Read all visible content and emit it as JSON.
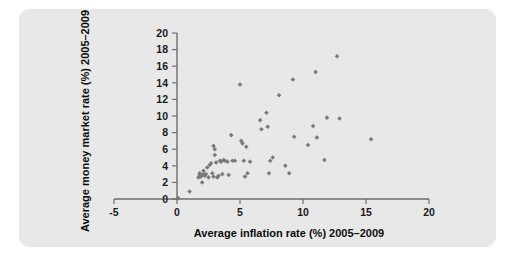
{
  "figure": {
    "panel_background": "#e8e8e8",
    "page_background": "#ffffff",
    "marker_color": "#7a7a7a",
    "axis_color": "#6e6e6e"
  },
  "chart_data": {
    "type": "scatter",
    "title": "",
    "xlabel": "Average inflation rate (%) 2005–2009",
    "ylabel": "Average money market rate (%) 2005–2009",
    "xlim": [
      -5,
      20
    ],
    "ylim": [
      0,
      20
    ],
    "xticks": [
      -5,
      0,
      5,
      10,
      15,
      20
    ],
    "yticks": [
      0,
      2,
      4,
      6,
      8,
      10,
      12,
      14,
      16,
      18,
      20
    ],
    "xtick_labels": [
      "-5",
      "0",
      "5",
      "10",
      "15",
      "20"
    ],
    "ytick_labels": [
      "0",
      "2",
      "4",
      "6",
      "8",
      "10",
      "12",
      "14",
      "16",
      "18",
      "20"
    ],
    "grid": false,
    "legend": null,
    "marker": "diamond",
    "series": [
      {
        "name": "Countries",
        "points": [
          [
            0.1,
            0.1
          ],
          [
            1.0,
            0.9
          ],
          [
            1.7,
            2.6
          ],
          [
            1.8,
            2.9
          ],
          [
            1.8,
            3.1
          ],
          [
            1.9,
            2.7
          ],
          [
            2.0,
            2.0
          ],
          [
            2.0,
            2.9
          ],
          [
            2.1,
            3.0
          ],
          [
            2.1,
            3.4
          ],
          [
            2.2,
            2.8
          ],
          [
            2.3,
            3.0
          ],
          [
            2.4,
            3.8
          ],
          [
            2.5,
            2.6
          ],
          [
            2.6,
            4.1
          ],
          [
            2.7,
            4.3
          ],
          [
            2.8,
            3.1
          ],
          [
            2.9,
            2.7
          ],
          [
            2.9,
            6.4
          ],
          [
            3.0,
            6.0
          ],
          [
            3.0,
            5.3
          ],
          [
            3.1,
            4.4
          ],
          [
            3.2,
            2.6
          ],
          [
            3.3,
            2.8
          ],
          [
            3.4,
            4.6
          ],
          [
            3.5,
            4.5
          ],
          [
            3.6,
            3.0
          ],
          [
            3.7,
            4.7
          ],
          [
            3.8,
            4.6
          ],
          [
            4.0,
            4.5
          ],
          [
            4.1,
            2.9
          ],
          [
            4.3,
            7.7
          ],
          [
            4.4,
            4.6
          ],
          [
            4.6,
            4.6
          ],
          [
            5.0,
            13.8
          ],
          [
            5.1,
            7.0
          ],
          [
            5.2,
            6.7
          ],
          [
            5.3,
            4.6
          ],
          [
            5.4,
            2.7
          ],
          [
            5.5,
            6.3
          ],
          [
            5.6,
            3.1
          ],
          [
            5.8,
            4.5
          ],
          [
            6.6,
            9.5
          ],
          [
            6.7,
            8.4
          ],
          [
            7.1,
            10.4
          ],
          [
            7.2,
            8.7
          ],
          [
            7.3,
            3.1
          ],
          [
            7.4,
            4.6
          ],
          [
            7.6,
            5.0
          ],
          [
            8.1,
            12.5
          ],
          [
            8.6,
            4.0
          ],
          [
            8.9,
            3.1
          ],
          [
            9.2,
            14.4
          ],
          [
            9.3,
            7.5
          ],
          [
            10.4,
            6.5
          ],
          [
            10.8,
            8.8
          ],
          [
            11.0,
            15.3
          ],
          [
            11.1,
            7.4
          ],
          [
            11.7,
            4.7
          ],
          [
            11.9,
            9.8
          ],
          [
            12.7,
            17.2
          ],
          [
            12.9,
            9.7
          ],
          [
            15.4,
            7.2
          ]
        ]
      }
    ]
  }
}
